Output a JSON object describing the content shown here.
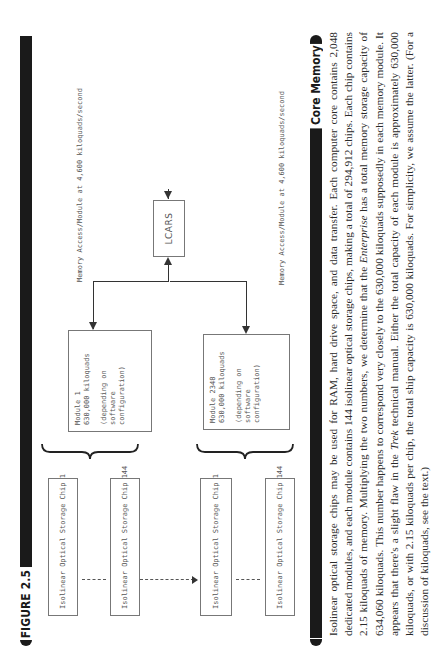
{
  "figure": {
    "label": "FIGURE 2.5",
    "memory_access_label_1": "Memory Access/Module at 4,600 kiloquads/second",
    "memory_access_label_2": "Memory Access/Module at 4,600 kiloquads/second",
    "lcars_box": "LCARS",
    "modules": [
      {
        "name": "Module 1",
        "capacity": "630,000 kiloquads",
        "note_line1": "(depending on",
        "note_line2": "software",
        "note_line3": "configuration)"
      },
      {
        "name": "Module 2348",
        "capacity": "630,000 kiloquads",
        "note_line1": "(depending on",
        "note_line2": "software",
        "note_line3": "configuration)"
      }
    ],
    "chips": [
      {
        "label": "Isolinear Optical Storage Chip 1"
      },
      {
        "label": "Isolinear Optical Storage Chip 144"
      },
      {
        "label": "Isolinear Optical Storage Chip 1"
      },
      {
        "label": "Isolinear Optical Storage Chip 144"
      }
    ]
  },
  "section": {
    "title": "Core Memory",
    "body_part1": "Isolinear optical storage chips may be used for RAM, hard drive space, and data transfer. Each computer core contains 2,048 dedicated modules, and each module contains 144 isolinear optical storage chips, making a total of 294,912 chips. Each chip contains 2.15 kiloquads of memory. Multiplying the two numbers, we determine that the ",
    "body_italic1": "Enterprise",
    "body_part2": " has a total memory storage capacity of 634,060 kiloquads. This number happens to correspond very closely to the 630,000 kiloquads supposedly in each memory module. It appears that there's a slight flaw in the ",
    "body_italic2": "Trek",
    "body_part3": " technical manual. Either the total capacity of each module is approximately 630,000 kiloquads, or with 2.15 kiloquads per chip, the total ship capacity is 630,000 kiloquads. For simplicity, we assume the latter. (For a discussion of kiloquads, see the text.)"
  }
}
